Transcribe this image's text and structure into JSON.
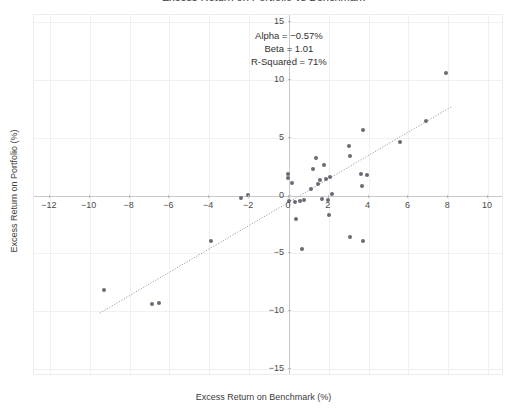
{
  "chart_data": {
    "type": "scatter",
    "title": "Excess Return on Portfolio vs Benchmark",
    "xlabel": "Excess Return on Benchmark (%)",
    "ylabel": "Excess Return on Portfolio (%)",
    "xlim": [
      -12.8,
      10.8
    ],
    "ylim": [
      -15.6,
      15.6
    ],
    "xticks": [
      -12,
      -10,
      -8,
      -6,
      -4,
      -2,
      0,
      2,
      4,
      6,
      8,
      10
    ],
    "xtick_labels": [
      "−12",
      "−10",
      "−8",
      "−6",
      "−4",
      "−2",
      "0",
      "2",
      "4",
      "6",
      "8",
      "10"
    ],
    "yticks": [
      15,
      10,
      5,
      0,
      -5,
      -10,
      -15
    ],
    "ytick_labels": [
      "15",
      "10",
      "5",
      "0",
      "−5",
      "−10",
      "−15"
    ],
    "grid": true,
    "legend": "none",
    "marker_color": "#6b6b78",
    "line_color": "#9aa0a8",
    "points": [
      [
        -9.3,
        -8.2
      ],
      [
        -6.9,
        -9.4
      ],
      [
        -6.5,
        -9.3
      ],
      [
        -3.9,
        -3.9
      ],
      [
        -2.4,
        -0.2
      ],
      [
        -2.05,
        0.05
      ],
      [
        -0.05,
        1.9
      ],
      [
        -0.05,
        1.5
      ],
      [
        0.0,
        -0.5
      ],
      [
        0.15,
        1.1
      ],
      [
        0.3,
        -0.55
      ],
      [
        0.35,
        -2.0
      ],
      [
        0.55,
        -0.5
      ],
      [
        0.65,
        -4.6
      ],
      [
        0.75,
        -0.35
      ],
      [
        1.1,
        0.6
      ],
      [
        1.2,
        2.3
      ],
      [
        1.35,
        3.2
      ],
      [
        1.45,
        1.0
      ],
      [
        1.55,
        1.3
      ],
      [
        1.65,
        -0.3
      ],
      [
        1.75,
        2.6
      ],
      [
        1.85,
        1.4
      ],
      [
        1.95,
        -0.35
      ],
      [
        2.0,
        -1.7
      ],
      [
        2.05,
        1.6
      ],
      [
        2.15,
        0.15
      ],
      [
        3.0,
        4.3
      ],
      [
        3.05,
        3.4
      ],
      [
        3.05,
        -3.6
      ],
      [
        3.6,
        1.9
      ],
      [
        3.65,
        0.8
      ],
      [
        3.7,
        5.7
      ],
      [
        3.9,
        1.75
      ],
      [
        3.7,
        -3.9
      ],
      [
        5.6,
        4.6
      ],
      [
        6.9,
        6.4
      ],
      [
        7.9,
        10.6
      ]
    ],
    "fit_line": {
      "slope": 1.01,
      "intercept": -0.57,
      "x_start": -9.5,
      "x_end": 8.2
    },
    "annotations": {
      "alpha": "Alpha = −0.57%",
      "beta": "Beta = 1.01",
      "r_squared": "R-Squared = 71%"
    }
  }
}
